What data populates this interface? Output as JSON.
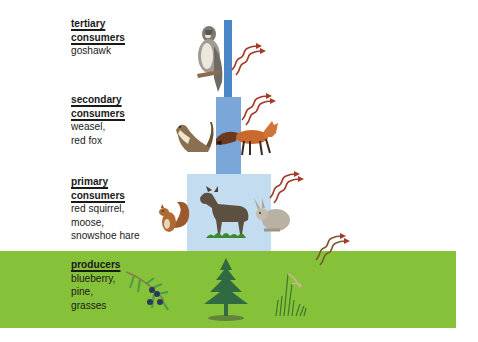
{
  "diagram": {
    "type": "energy-pyramid",
    "levels": [
      {
        "title_line1": "tertiary",
        "title_line2": "consumers",
        "organisms_line1": "goshawk",
        "organisms_line2": "",
        "organisms_line3": "",
        "block_color": "#4a86c8"
      },
      {
        "title_line1": "secondary",
        "title_line2": "consumers",
        "organisms_line1": "weasel,",
        "organisms_line2": "red fox",
        "organisms_line3": "",
        "block_color": "#7aa7d8"
      },
      {
        "title_line1": "primary",
        "title_line2": "consumers",
        "organisms_line1": "red squirrel,",
        "organisms_line2": "moose,",
        "organisms_line3": "snowshoe hare",
        "block_color": "#c4dcf0"
      },
      {
        "title_line1": "producers",
        "title_line2": "",
        "organisms_line1": "blueberry,",
        "organisms_line2": "pine,",
        "organisms_line3": "grasses",
        "block_color": "#86c13a"
      }
    ],
    "illustrations": [
      "goshawk",
      "weasel",
      "red-fox",
      "red-squirrel",
      "moose",
      "snowshoe-hare",
      "blueberry-branch",
      "pine-tree",
      "grasses"
    ],
    "heat_arrow_color": "#a33a2a"
  }
}
